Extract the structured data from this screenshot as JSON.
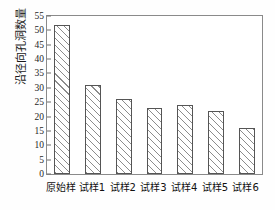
{
  "chart_data": {
    "type": "bar",
    "title": "",
    "xlabel": "",
    "ylabel": "沿径向孔洞数量",
    "categories": [
      "原始样",
      "试样1",
      "试样2",
      "试样3",
      "试样4",
      "试样5",
      "试样6"
    ],
    "values": [
      52,
      31,
      26,
      23,
      24,
      22,
      16
    ],
    "ylim": [
      0,
      55
    ],
    "ytick_step": 5,
    "yticks": [
      0,
      5,
      10,
      15,
      20,
      25,
      30,
      35,
      40,
      45,
      50,
      55
    ],
    "ytick_labels": [
      "0",
      "5",
      "10",
      "15",
      "20",
      "25",
      "30",
      "35",
      "40",
      "45",
      "50",
      "55"
    ],
    "grid": false,
    "legend": null,
    "series": [
      {
        "name": "沿径向孔洞数量",
        "values": [
          52,
          31,
          26,
          23,
          24,
          22,
          16
        ]
      }
    ],
    "bar_style": {
      "fill": "#ffffff",
      "hatch": "diagonal",
      "edge_color": "#555555"
    },
    "frame": {
      "box": true,
      "color": "#8a8a8a"
    },
    "background": "#fefefe"
  }
}
